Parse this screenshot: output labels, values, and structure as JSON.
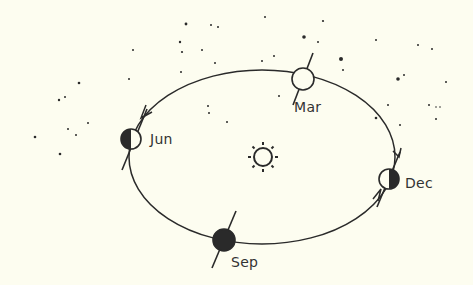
{
  "diagram": {
    "type": "earth-orbit-around-sun",
    "colors": {
      "background": "#fdfdf0",
      "ink": "#2a2a2a",
      "label": "#333333"
    },
    "sun": {
      "icon": "sun-icon",
      "cx": 263,
      "cy": 157,
      "r": 10
    },
    "orbit": {
      "cx": 262,
      "cy": 157,
      "rx": 133,
      "ry": 87,
      "direction": "counter-clockwise"
    },
    "positions": [
      {
        "month": "Mar",
        "phase": "full-lit",
        "x": 303,
        "y": 79,
        "label_x": 292,
        "label_y": 88
      },
      {
        "month": "Jun",
        "phase": "left-dark",
        "x": 131,
        "y": 139,
        "label_x": 150,
        "label_y": 132
      },
      {
        "month": "Sep",
        "phase": "full-dark",
        "x": 224,
        "y": 240,
        "label_x": 232,
        "label_y": 253
      },
      {
        "month": "Dec",
        "phase": "right-dark",
        "x": 389,
        "y": 179,
        "label_x": 405,
        "label_y": 176
      }
    ]
  }
}
